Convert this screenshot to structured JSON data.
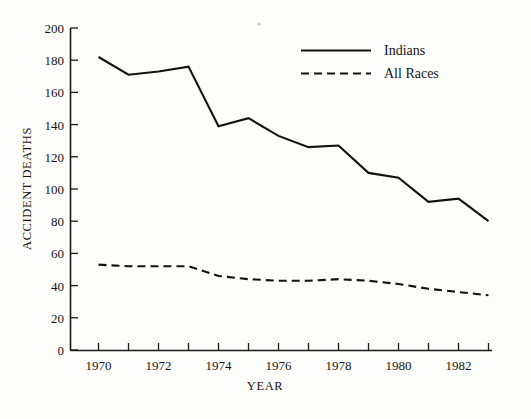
{
  "chart_data": {
    "type": "line",
    "title": "",
    "xlabel": "YEAR",
    "ylabel": "ACCIDENT DEATHS",
    "xlim": [
      1969.1,
      1983.6
    ],
    "ylim": [
      0,
      200
    ],
    "grid": false,
    "legend_position": "top-right",
    "x": [
      1970,
      1971,
      1972,
      1973,
      1974,
      1975,
      1976,
      1977,
      1978,
      1979,
      1980,
      1981,
      1982,
      1983
    ],
    "xtick_values": [
      1970,
      1971,
      1972,
      1973,
      1974,
      1975,
      1976,
      1977,
      1978,
      1979,
      1980,
      1981,
      1982,
      1983
    ],
    "xtick_labels": [
      "1970",
      "",
      "1972",
      "",
      "1974",
      "",
      "1976",
      "",
      "1978",
      "",
      "1980",
      "",
      "1982",
      ""
    ],
    "xtick_labels_shown": [
      "1970",
      "1972",
      "1974",
      "1976",
      "1978",
      "1980",
      "1982"
    ],
    "ytick_values": [
      0,
      20,
      40,
      60,
      80,
      100,
      120,
      140,
      160,
      180,
      200
    ],
    "ytick_labels": [
      "0",
      "20",
      "40",
      "60",
      "80",
      "100",
      "120",
      "140",
      "160",
      "180",
      "200"
    ],
    "series": [
      {
        "name": "Indians",
        "style": "solid",
        "color": "#121212",
        "values": [
          182,
          171,
          173,
          176,
          139,
          144,
          133,
          126,
          127,
          110,
          107,
          92,
          94,
          80
        ]
      },
      {
        "name": "All Races",
        "style": "dashed",
        "color": "#121212",
        "values": [
          53,
          52,
          52,
          52,
          46,
          44,
          43,
          43,
          44,
          43,
          41,
          38,
          36,
          34
        ]
      }
    ]
  },
  "legend": {
    "items": [
      {
        "label": "Indians",
        "style": "solid"
      },
      {
        "label": "All Races",
        "style": "dashed"
      }
    ]
  },
  "axes": {
    "y_title": "ACCIDENT DEATHS",
    "x_title": "YEAR"
  }
}
